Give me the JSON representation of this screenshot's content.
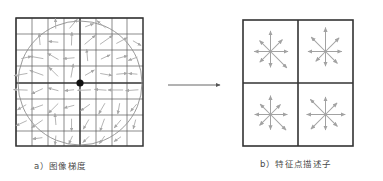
{
  "figure": {
    "panels": [
      {
        "id": "image-gradients",
        "caption": "a）图像梯度",
        "grid": {
          "cols": 8,
          "rows": 8,
          "x": 16,
          "y": 18,
          "width": 127,
          "height": 128
        },
        "circle": {
          "cx": 80,
          "cy": 83,
          "r": 62
        },
        "keypoint": {
          "cx": 80,
          "cy": 83,
          "r": 3.6,
          "color": "#111111"
        }
      },
      {
        "id": "keypoint-descriptor",
        "caption": "b）特征点描述子",
        "grid": {
          "cols": 2,
          "rows": 2,
          "x": 243,
          "y": 20,
          "width": 110,
          "height": 126
        }
      }
    ],
    "arrow_connector": {
      "x1": 168,
      "y1": 85,
      "x2": 222,
      "y2": 85,
      "label": "maps-to"
    },
    "colors": {
      "grid_line": "#5a5a5a",
      "grid_line_bold": "#333333",
      "gradient_arrow": "#a6a6a6",
      "descriptor_arrow": "#a2a2a2",
      "circle": "#8e8e8e",
      "keypoint": "#111111",
      "connector": "#555555",
      "caption_text": "#4a4a4a",
      "background": "#ffffff"
    }
  },
  "chart_data": {
    "type": "scatter",
    "xlabel": "",
    "ylabel": "",
    "panel_a": {
      "description": "8x8 sampling grid of image gradients around a keypoint, with Gaussian weighting circle",
      "grid_cols": 8,
      "grid_rows": 8,
      "gradients": [
        {
          "cell": [
            0,
            0
          ],
          "angle": 35,
          "magnitude": 0.78
        },
        {
          "cell": [
            1,
            0
          ],
          "angle": 178,
          "magnitude": 0.62
        },
        {
          "cell": [
            2,
            0
          ],
          "angle": 92,
          "magnitude": 0.4
        },
        {
          "cell": [
            3,
            0
          ],
          "angle": 50,
          "magnitude": 0.55
        },
        {
          "cell": [
            4,
            0
          ],
          "angle": 20,
          "magnitude": 0.3
        },
        {
          "cell": [
            5,
            0
          ],
          "angle": 140,
          "magnitude": 0.48
        },
        {
          "cell": [
            6,
            0
          ],
          "angle": 60,
          "magnitude": 0.35
        },
        {
          "cell": [
            7,
            0
          ],
          "angle": 10,
          "magnitude": 0.25
        },
        {
          "cell": [
            0,
            1
          ],
          "angle": 300,
          "magnitude": 0.45
        },
        {
          "cell": [
            1,
            1
          ],
          "angle": 95,
          "magnitude": 0.52
        },
        {
          "cell": [
            2,
            1
          ],
          "angle": 175,
          "magnitude": 0.38
        },
        {
          "cell": [
            3,
            1
          ],
          "angle": 88,
          "magnitude": 0.66
        },
        {
          "cell": [
            4,
            1
          ],
          "angle": 40,
          "magnitude": 0.72
        },
        {
          "cell": [
            5,
            1
          ],
          "angle": 35,
          "magnitude": 0.85
        },
        {
          "cell": [
            6,
            1
          ],
          "angle": 28,
          "magnitude": 0.58
        },
        {
          "cell": [
            7,
            1
          ],
          "angle": 330,
          "magnitude": 0.33
        },
        {
          "cell": [
            0,
            2
          ],
          "angle": 12,
          "magnitude": 0.42
        },
        {
          "cell": [
            1,
            2
          ],
          "angle": 170,
          "magnitude": 0.7
        },
        {
          "cell": [
            2,
            2
          ],
          "angle": 150,
          "magnitude": 0.6
        },
        {
          "cell": [
            3,
            2
          ],
          "angle": 185,
          "magnitude": 0.5
        },
        {
          "cell": [
            4,
            2
          ],
          "angle": 95,
          "magnitude": 0.55
        },
        {
          "cell": [
            5,
            2
          ],
          "angle": 25,
          "magnitude": 0.4
        },
        {
          "cell": [
            6,
            2
          ],
          "angle": 15,
          "magnitude": 0.52
        },
        {
          "cell": [
            7,
            2
          ],
          "angle": 200,
          "magnitude": 0.36
        },
        {
          "cell": [
            0,
            3
          ],
          "angle": 190,
          "magnitude": 0.68
        },
        {
          "cell": [
            1,
            3
          ],
          "angle": 160,
          "magnitude": 0.75
        },
        {
          "cell": [
            2,
            3
          ],
          "angle": 135,
          "magnitude": 0.62
        },
        {
          "cell": [
            3,
            3
          ],
          "angle": 80,
          "magnitude": 0.7
        },
        {
          "cell": [
            4,
            3
          ],
          "angle": 30,
          "magnitude": 0.45
        },
        {
          "cell": [
            5,
            3
          ],
          "angle": 350,
          "magnitude": 0.55
        },
        {
          "cell": [
            6,
            3
          ],
          "angle": 5,
          "magnitude": 0.48
        },
        {
          "cell": [
            7,
            3
          ],
          "angle": 175,
          "magnitude": 0.3
        },
        {
          "cell": [
            0,
            4
          ],
          "angle": 178,
          "magnitude": 0.72
        },
        {
          "cell": [
            1,
            4
          ],
          "angle": 205,
          "magnitude": 0.58
        },
        {
          "cell": [
            2,
            4
          ],
          "angle": 165,
          "magnitude": 0.45
        },
        {
          "cell": [
            3,
            4
          ],
          "angle": 186,
          "magnitude": 0.35
        },
        {
          "cell": [
            4,
            4
          ],
          "angle": 182,
          "magnitude": 0.66
        },
        {
          "cell": [
            5,
            4
          ],
          "angle": 176,
          "magnitude": 0.55
        },
        {
          "cell": [
            6,
            4
          ],
          "angle": 180,
          "magnitude": 0.8
        },
        {
          "cell": [
            7,
            4
          ],
          "angle": 184,
          "magnitude": 0.62
        },
        {
          "cell": [
            0,
            5
          ],
          "angle": 210,
          "magnitude": 0.4
        },
        {
          "cell": [
            1,
            5
          ],
          "angle": 200,
          "magnitude": 0.62
        },
        {
          "cell": [
            2,
            5
          ],
          "angle": 225,
          "magnitude": 0.7
        },
        {
          "cell": [
            3,
            5
          ],
          "angle": 195,
          "magnitude": 0.44
        },
        {
          "cell": [
            4,
            5
          ],
          "angle": 215,
          "magnitude": 0.5
        },
        {
          "cell": [
            5,
            5
          ],
          "angle": 240,
          "magnitude": 0.58
        },
        {
          "cell": [
            6,
            5
          ],
          "angle": 260,
          "magnitude": 0.46
        },
        {
          "cell": [
            7,
            5
          ],
          "angle": 230,
          "magnitude": 0.34
        },
        {
          "cell": [
            0,
            6
          ],
          "angle": 205,
          "magnitude": 0.55
        },
        {
          "cell": [
            1,
            6
          ],
          "angle": 215,
          "magnitude": 0.68
        },
        {
          "cell": [
            2,
            6
          ],
          "angle": 95,
          "magnitude": 0.52
        },
        {
          "cell": [
            3,
            6
          ],
          "angle": 270,
          "magnitude": 0.6
        },
        {
          "cell": [
            4,
            6
          ],
          "angle": 240,
          "magnitude": 0.48
        },
        {
          "cell": [
            5,
            6
          ],
          "angle": 250,
          "magnitude": 0.65
        },
        {
          "cell": [
            6,
            6
          ],
          "angle": 230,
          "magnitude": 0.42
        },
        {
          "cell": [
            7,
            6
          ],
          "angle": 255,
          "magnitude": 0.36
        },
        {
          "cell": [
            0,
            7
          ],
          "angle": 200,
          "magnitude": 0.3
        },
        {
          "cell": [
            1,
            7
          ],
          "angle": 188,
          "magnitude": 0.38
        },
        {
          "cell": [
            2,
            7
          ],
          "angle": 265,
          "magnitude": 0.34
        },
        {
          "cell": [
            3,
            7
          ],
          "angle": 245,
          "magnitude": 0.3
        },
        {
          "cell": [
            4,
            7
          ],
          "angle": 225,
          "magnitude": 0.28
        },
        {
          "cell": [
            5,
            7
          ],
          "angle": 235,
          "magnitude": 0.32
        },
        {
          "cell": [
            6,
            7
          ],
          "angle": 215,
          "magnitude": 0.26
        },
        {
          "cell": [
            7,
            7
          ],
          "angle": 250,
          "magnitude": 0.24
        }
      ]
    },
    "panel_b": {
      "description": "2x2 array of orientation histograms, each with 8 directional bins",
      "bins": 8,
      "bin_angles": [
        0,
        45,
        90,
        135,
        180,
        225,
        270,
        315
      ],
      "cells": [
        {
          "cell": [
            0,
            0
          ],
          "magnitudes": [
            0.62,
            0.58,
            0.8,
            0.5,
            0.55,
            0.48,
            0.52,
            0.95
          ]
        },
        {
          "cell": [
            1,
            0
          ],
          "magnitudes": [
            0.55,
            0.72,
            1.0,
            0.78,
            0.62,
            0.4,
            0.45,
            0.58
          ]
        },
        {
          "cell": [
            0,
            1
          ],
          "magnitudes": [
            0.58,
            0.42,
            0.7,
            0.45,
            0.52,
            0.5,
            0.48,
            0.88
          ]
        },
        {
          "cell": [
            1,
            1
          ],
          "magnitudes": [
            0.75,
            0.55,
            0.62,
            0.85,
            0.7,
            0.8,
            0.5,
            0.58
          ]
        }
      ]
    }
  }
}
